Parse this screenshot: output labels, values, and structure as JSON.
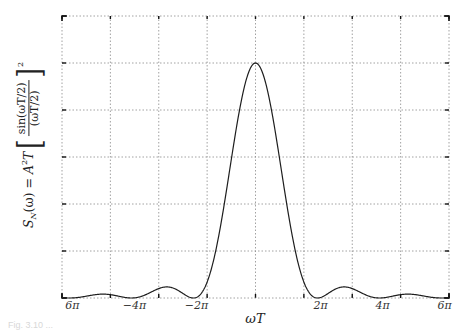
{
  "chart_data": {
    "type": "line",
    "title": "",
    "function": "S_N(omega) = A^2 T [sin(omega T/2)/(omega T/2)]^2",
    "xlabel": "ωT",
    "ylabel": {
      "lhs": "S",
      "lhs_sub": "N",
      "lhs_arg": "(ω) = ",
      "coef": "A",
      "coef_sup": "2",
      "coef_tail": "T",
      "numerator": "sin(ωT/2)",
      "denominator": "(ωT/2)",
      "power": "2"
    },
    "xlim_over_pi": [
      -6.24,
      6.24
    ],
    "ylim": [
      0,
      1.2
    ],
    "peak_value": 1.0,
    "grid": true,
    "x_gridlines": 9,
    "y_gridlines": 7,
    "x_tick_labels": [
      {
        "label": "6π",
        "x_over_pi": -6
      },
      {
        "label": "−4π",
        "x_over_pi": -4
      },
      {
        "label": "−2π",
        "x_over_pi": -2
      },
      {
        "label": "2π",
        "x_over_pi": 2
      },
      {
        "label": "4π",
        "x_over_pi": 4
      },
      {
        "label": "6π",
        "x_over_pi": 6
      }
    ],
    "key_points": [
      {
        "x_over_pi": 0,
        "y": 1.0,
        "note": "main lobe peak"
      },
      {
        "x_over_pi": -2,
        "y": 0.0
      },
      {
        "x_over_pi": 2,
        "y": 0.0
      },
      {
        "x_over_pi": -2.86,
        "y": 0.047,
        "note": "first sidelobe"
      },
      {
        "x_over_pi": 2.86,
        "y": 0.047,
        "note": "first sidelobe"
      },
      {
        "x_over_pi": -4,
        "y": 0.0
      },
      {
        "x_over_pi": 4,
        "y": 0.0
      },
      {
        "x_over_pi": -4.92,
        "y": 0.016,
        "note": "second sidelobe"
      },
      {
        "x_over_pi": 4.92,
        "y": 0.016,
        "note": "second sidelobe"
      },
      {
        "x_over_pi": -6,
        "y": 0.0
      },
      {
        "x_over_pi": 6,
        "y": 0.0
      }
    ]
  },
  "caption": "Fig. 3.10 ..."
}
